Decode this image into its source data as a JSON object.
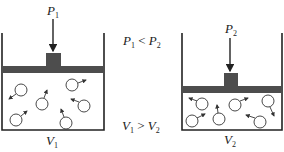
{
  "diagram": {
    "colors": {
      "ink": "#222222",
      "piston": "#4d4d4d",
      "background": "#ffffff"
    },
    "left_container": {
      "pressure_label": "P",
      "pressure_sub": "1",
      "volume_label": "V",
      "volume_sub": "1",
      "molecule_count": 6
    },
    "right_container": {
      "pressure_label": "P",
      "pressure_sub": "2",
      "volume_label": "V",
      "volume_sub": "2",
      "molecule_count": 6
    },
    "relations": {
      "pressure": {
        "a": "P",
        "a_sub": "1",
        "op": " < ",
        "b": "P",
        "b_sub": "2"
      },
      "volume": {
        "a": "V",
        "a_sub": "1",
        "op": " > ",
        "b": "V",
        "b_sub": "2"
      }
    }
  }
}
